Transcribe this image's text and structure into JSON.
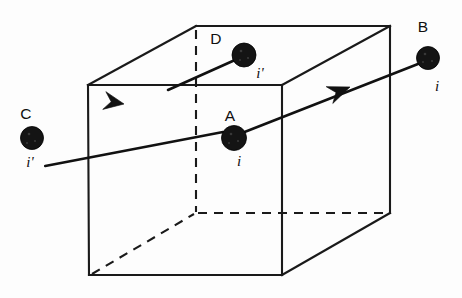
{
  "figure": {
    "background_color": "#fdfdfd",
    "line_color": "#1a1a1a",
    "dot_color": "#141414",
    "cube": {
      "front_face": {
        "top_left": [
          88,
          85
        ],
        "top_right": [
          282,
          85
        ],
        "bottom_right": [
          282,
          275
        ],
        "bottom_left": [
          89,
          275
        ]
      },
      "back_face": {
        "top_left": [
          196,
          26
        ],
        "top_right": [
          390,
          26
        ],
        "bottom_right": [
          390,
          213
        ],
        "bottom_left": [
          196,
          213
        ]
      },
      "hidden_vertex": "back_bottom_left",
      "hidden_edge_style": "dashed"
    },
    "nodes": [
      {
        "id": "node-c",
        "label": "C",
        "current": "i'",
        "center": [
          32,
          138
        ],
        "radius": 11.5,
        "label_pos": [
          26,
          119
        ],
        "current_pos": [
          30,
          167
        ]
      },
      {
        "id": "node-d",
        "label": "D",
        "current": "i'",
        "center": [
          244,
          55
        ],
        "radius": 12,
        "label_pos": [
          214,
          44
        ],
        "current_pos": [
          258,
          77
        ]
      },
      {
        "id": "node-a",
        "label": "A",
        "current": "i",
        "center": [
          234,
          138
        ],
        "radius": 12.5,
        "label_pos": [
          228,
          120
        ],
        "current_pos": [
          239,
          166
        ]
      },
      {
        "id": "node-b",
        "label": "B",
        "current": "i",
        "center": [
          428,
          58
        ],
        "radius": 11.5,
        "label_pos": [
          421,
          31
        ],
        "current_pos": [
          436,
          90
        ]
      }
    ],
    "rays": [
      {
        "id": "ray-lower",
        "from": "A",
        "through": "C",
        "direction": "right-to-left-arrow-points-left",
        "start": [
          42,
          133
        ],
        "end": [
          224,
          133
        ],
        "arrow_at": [
          124,
          104
        ],
        "arrow_heading": "left"
      },
      {
        "id": "ray-upper",
        "from": "A",
        "through": "B",
        "direction": "left-to-right-arrow-points-right",
        "start": [
          244,
          131
        ],
        "end": [
          418,
          62
        ],
        "arrow_at": [
          338,
          90
        ],
        "arrow_heading": "right"
      }
    ]
  }
}
